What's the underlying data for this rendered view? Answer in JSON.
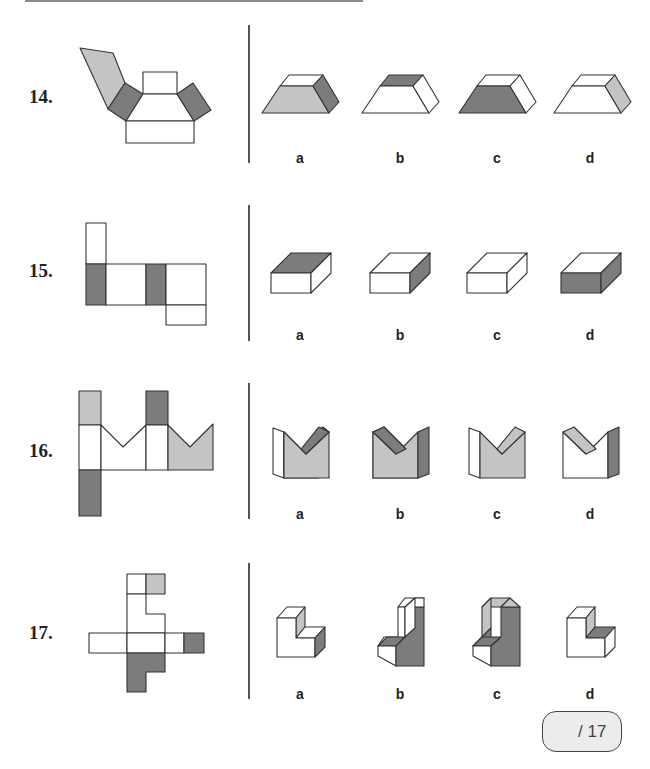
{
  "colors": {
    "light": "#c4c4c4",
    "dark": "#7c7c7c",
    "white": "#ffffff",
    "stroke": "#333333"
  },
  "questions": [
    {
      "number": "14.",
      "options": [
        "a",
        "b",
        "c",
        "d"
      ]
    },
    {
      "number": "15.",
      "options": [
        "a",
        "b",
        "c",
        "d"
      ]
    },
    {
      "number": "16.",
      "options": [
        "a",
        "b",
        "c",
        "d"
      ]
    },
    {
      "number": "17.",
      "options": [
        "a",
        "b",
        "c",
        "d"
      ]
    }
  ],
  "score": {
    "label": "/ 17"
  }
}
